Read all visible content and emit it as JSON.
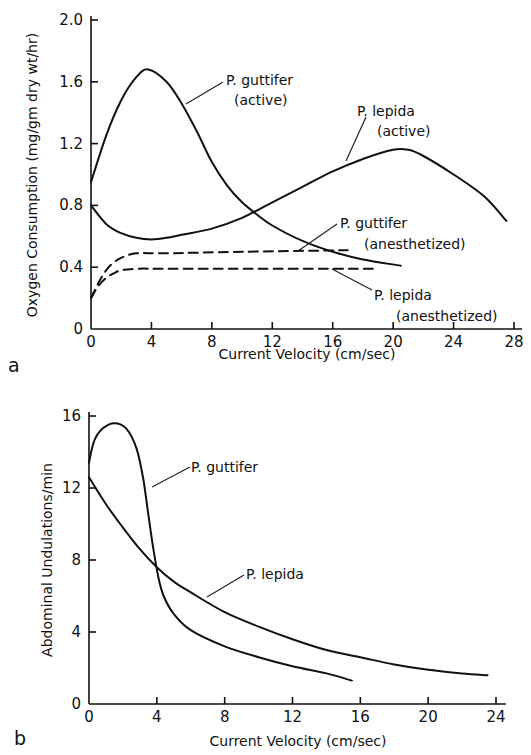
{
  "chart_data": [
    {
      "panel": "a",
      "type": "line",
      "title": "",
      "xlabel": "Current Velocity (cm/sec)",
      "ylabel": "Oxygen Consumption (mg/gm dry wt/hr)",
      "xlim": [
        0,
        28
      ],
      "ylim": [
        0,
        2.0
      ],
      "xticks": [
        0,
        4,
        8,
        12,
        16,
        20,
        24,
        28
      ],
      "yticks": [
        0,
        0.4,
        0.8,
        1.2,
        1.6,
        2.0
      ],
      "ytick_labels": [
        "0",
        "0.4",
        "0.8",
        "1.2",
        "1.6",
        "2.0"
      ],
      "grid": false,
      "series": [
        {
          "name": "P. guttifer (active)",
          "style": "solid",
          "x": [
            0,
            1,
            2,
            3,
            3.8,
            5,
            6,
            7,
            8,
            9,
            10,
            11,
            12,
            14,
            16,
            18,
            20.5
          ],
          "y": [
            0.95,
            1.25,
            1.48,
            1.63,
            1.68,
            1.6,
            1.46,
            1.28,
            1.08,
            0.93,
            0.82,
            0.74,
            0.67,
            0.57,
            0.5,
            0.45,
            0.41
          ]
        },
        {
          "name": "P. lepida (active)",
          "style": "solid",
          "x": [
            0,
            1,
            2,
            3,
            4,
            5,
            6,
            8,
            10,
            12,
            14,
            16,
            18,
            20,
            21,
            22,
            24,
            26,
            27.5
          ],
          "y": [
            0.8,
            0.68,
            0.62,
            0.59,
            0.58,
            0.59,
            0.61,
            0.65,
            0.72,
            0.82,
            0.92,
            1.02,
            1.1,
            1.16,
            1.16,
            1.12,
            1.0,
            0.86,
            0.7
          ]
        },
        {
          "name": "P. guttifer (anesthetized)",
          "style": "dashed",
          "x": [
            0,
            0.5,
            1,
            1.5,
            2,
            3,
            5,
            10,
            17
          ],
          "y": [
            0.2,
            0.3,
            0.38,
            0.43,
            0.46,
            0.49,
            0.49,
            0.5,
            0.51
          ]
        },
        {
          "name": "P. lepida (anesthetized)",
          "style": "dashed",
          "x": [
            0,
            0.5,
            1,
            1.5,
            2,
            3,
            5,
            10,
            19
          ],
          "y": [
            0.2,
            0.28,
            0.33,
            0.36,
            0.38,
            0.39,
            0.39,
            0.39,
            0.39
          ]
        }
      ],
      "annotations": [
        {
          "text_lines": [
            "P. guttifer",
            "(active)"
          ],
          "points_to_series": "P. guttifer (active)"
        },
        {
          "text_lines": [
            "P. lepida",
            "(active)"
          ],
          "points_to_series": "P. lepida (active)"
        },
        {
          "text_lines": [
            "P. guttifer",
            "(anesthetized)"
          ],
          "points_to_series": "P. guttifer (anesthetized)"
        },
        {
          "text_lines": [
            "P. lepida",
            "(anesthetized)"
          ],
          "points_to_series": "P. lepida (anesthetized)"
        }
      ]
    },
    {
      "panel": "b",
      "type": "line",
      "title": "",
      "xlabel": "Current Velocity (cm/sec)",
      "ylabel": "Abdominal Undulations/min",
      "xlim": [
        0,
        24
      ],
      "ylim": [
        0,
        16
      ],
      "xticks": [
        0,
        4,
        8,
        12,
        16,
        20,
        24
      ],
      "yticks": [
        0,
        4,
        8,
        12,
        16
      ],
      "ytick_labels": [
        "0",
        "4",
        "8",
        "12",
        "16"
      ],
      "grid": false,
      "series": [
        {
          "name": "P. guttifer",
          "style": "solid",
          "x": [
            0,
            0.3,
            0.8,
            1.5,
            2.2,
            2.8,
            3.2,
            3.5,
            3.8,
            4.1,
            4.4,
            5,
            6,
            8,
            10,
            12,
            14,
            15.5
          ],
          "y": [
            13.4,
            14.6,
            15.3,
            15.6,
            15.3,
            14.2,
            12.5,
            10.5,
            8.6,
            7.0,
            6.0,
            5.0,
            4.1,
            3.2,
            2.6,
            2.1,
            1.7,
            1.3
          ],
          "path_param": "t"
        },
        {
          "name": "P. lepida",
          "style": "solid",
          "x": [
            0,
            1,
            2,
            3,
            4,
            5,
            6,
            8,
            10,
            12,
            14,
            16,
            18,
            20,
            22,
            23.5
          ],
          "y": [
            12.6,
            11.1,
            9.8,
            8.6,
            7.6,
            6.8,
            6.2,
            5.1,
            4.3,
            3.6,
            3.0,
            2.6,
            2.2,
            1.9,
            1.7,
            1.6
          ]
        }
      ],
      "annotations": [
        {
          "text_lines": [
            "P. guttifer"
          ],
          "points_to_series": "P. guttifer"
        },
        {
          "text_lines": [
            "P. lepida"
          ],
          "points_to_series": "P. lepida"
        }
      ]
    }
  ],
  "figure": {
    "panel_a_label": "a",
    "panel_b_label": "b",
    "panel_a": {
      "xlabel": "Current Velocity (cm/sec)",
      "ylabel": "Oxygen Consumption (mg/gm dry wt/hr)",
      "anno_guttifer_active": [
        "P. guttifer",
        "(active)"
      ],
      "anno_lepida_active": [
        "P. lepida",
        "(active)"
      ],
      "anno_guttifer_anesth": [
        "P. guttifer",
        "(anesthetized)"
      ],
      "anno_lepida_anesth": [
        "P. lepida",
        "(anesthetized)"
      ]
    },
    "panel_b": {
      "xlabel": "Current Velocity (cm/sec)",
      "ylabel": "Abdominal Undulations/min",
      "anno_guttifer": "P. guttifer",
      "anno_lepida": "P. lepida"
    }
  }
}
